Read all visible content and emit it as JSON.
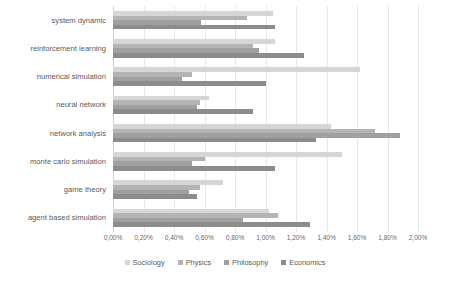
{
  "chart_data": {
    "type": "bar",
    "orientation": "horizontal",
    "title": "",
    "subtitle": "",
    "xlabel": "",
    "ylabel": "",
    "xlim": [
      0,
      2.0
    ],
    "grid": true,
    "legend_position": "bottom",
    "value_format": "percent",
    "tick_labels": [
      "0,00%",
      "0,20%",
      "0,40%",
      "0,60%",
      "0,80%",
      "1,00%",
      "1,20%",
      "1,40%",
      "1,60%",
      "1,80%",
      "2,00%"
    ],
    "tick_values": [
      0,
      0.2,
      0.4,
      0.6,
      0.8,
      1.0,
      1.2,
      1.4,
      1.6,
      1.8,
      2.0
    ],
    "categories": [
      "system dynamic",
      "reinforcement learning",
      "numerical simulation",
      "neural network",
      "network analysis",
      "monte carlo simulation",
      "game theory",
      "agent based simulation"
    ],
    "series": [
      {
        "name": "Sociology",
        "color": "#d6d6d6",
        "values": [
          1.05,
          1.06,
          1.62,
          0.63,
          1.43,
          1.5,
          0.72,
          1.02
        ]
      },
      {
        "name": "Physics",
        "color": "#b4b4b4",
        "values": [
          0.88,
          0.92,
          0.52,
          0.57,
          1.72,
          0.6,
          0.57,
          1.08
        ]
      },
      {
        "name": "Philosophy",
        "color": "#a0a0a0",
        "values": [
          0.58,
          0.96,
          0.45,
          0.55,
          1.88,
          0.52,
          0.5,
          0.85
        ]
      },
      {
        "name": "Economics",
        "color": "#8c8c8c",
        "values": [
          1.06,
          1.25,
          1.0,
          0.92,
          1.33,
          1.06,
          0.55,
          1.29
        ]
      }
    ]
  }
}
